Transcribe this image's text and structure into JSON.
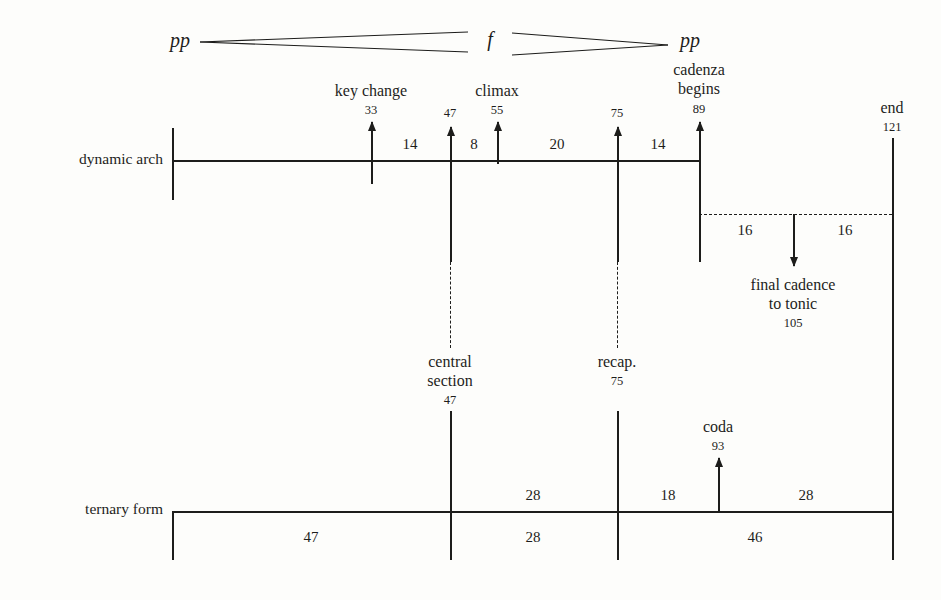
{
  "figure": {
    "type": "musical-form-diagram",
    "background": "#fdfdfb",
    "ink": "#1d1d1b"
  },
  "dynamics": {
    "start_marking": "pp",
    "peak_marking": "f",
    "end_marking": "pp",
    "shape": "crescendo to f then diminuendo to pp"
  },
  "rows": {
    "dynamic_arch_label": "dynamic arch",
    "ternary_form_label": "ternary form"
  },
  "events": [
    {
      "name": "key change",
      "bar": "33",
      "label_lines": [
        "key change"
      ]
    },
    {
      "name": "central section",
      "bar": "47",
      "label_lines": [
        "central",
        "section"
      ]
    },
    {
      "name": "climax",
      "bar": "55",
      "label_lines": [
        "climax"
      ]
    },
    {
      "name": "recap",
      "bar": "75",
      "label_lines": [
        "recap."
      ]
    },
    {
      "name": "cadenza begins",
      "bar": "89",
      "label_lines": [
        "cadenza",
        "begins"
      ]
    },
    {
      "name": "coda",
      "bar": "93",
      "label_lines": [
        "coda"
      ]
    },
    {
      "name": "final cadence to tonic",
      "bar": "105",
      "label_lines": [
        "final cadence",
        "to tonic"
      ]
    },
    {
      "name": "end",
      "bar": "121",
      "label_lines": [
        "end"
      ]
    }
  ],
  "marker_numbers": {
    "key_change": "33",
    "central_section_top": "47",
    "climax": "55",
    "recap_top": "75",
    "cadenza": "89",
    "end": "121",
    "central_section_bottom": "47",
    "recap_bottom": "75",
    "coda": "93",
    "final_cadence": "105"
  },
  "dynamic_arch_spans": [
    {
      "from": "33",
      "to": "47",
      "value": "14"
    },
    {
      "from": "47",
      "to": "55",
      "value": "8"
    },
    {
      "from": "55",
      "to": "75",
      "value": "20"
    },
    {
      "from": "75",
      "to": "89",
      "value": "14"
    }
  ],
  "cadenza_spans": [
    {
      "from": "89",
      "to": "105",
      "value": "16"
    },
    {
      "from": "105",
      "to": "121",
      "value": "16"
    }
  ],
  "ternary_upper_spans": [
    {
      "from": "47",
      "to": "75",
      "value": "28"
    },
    {
      "from": "75",
      "to": "93",
      "value": "18"
    },
    {
      "from": "93",
      "to": "121",
      "value": "28"
    }
  ],
  "ternary_section_spans": [
    {
      "section": "A",
      "value": "47"
    },
    {
      "section": "B",
      "value": "28"
    },
    {
      "section": "A1",
      "value": "46"
    }
  ]
}
